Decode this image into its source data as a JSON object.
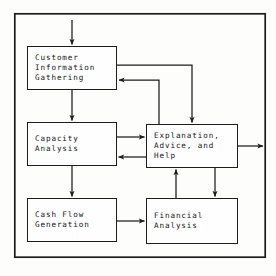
{
  "figure": {
    "caption_partial": "",
    "frame": {
      "border_color": "#1d1d1d",
      "background": "#fdfdfc",
      "x": 14,
      "y": 13,
      "width": 252,
      "height": 245
    },
    "style": {
      "box_border_color": "#1d1d1d",
      "box_fill": "#fefefe",
      "arrow_color": "#1d1d1d",
      "text_color": "#141414"
    }
  },
  "nodes": [
    {
      "id": "customer",
      "name": "customer-information-gathering",
      "lines": [
        "Customer",
        "Information",
        "Gathering"
      ]
    },
    {
      "id": "capacity",
      "name": "capacity-analysis",
      "lines": [
        "Capacity",
        "Analysis"
      ]
    },
    {
      "id": "cashflow",
      "name": "cash-flow-generation",
      "lines": [
        "Cash Flow",
        "Generation"
      ]
    },
    {
      "id": "explanation",
      "name": "explanation-advice-and-help",
      "lines": [
        "Explanation,",
        "Advice, and",
        "Help"
      ]
    },
    {
      "id": "financial",
      "name": "financial-analysis",
      "lines": [
        "Financial",
        "Analysis"
      ]
    }
  ],
  "edges": [
    {
      "id": "entry-to-customer",
      "from": "external-top",
      "to": "customer",
      "direction": "down",
      "label": ""
    },
    {
      "id": "customer-to-capacity",
      "from": "customer",
      "to": "capacity",
      "direction": "down",
      "label": ""
    },
    {
      "id": "capacity-to-cashflow",
      "from": "capacity",
      "to": "cashflow",
      "direction": "down",
      "label": ""
    },
    {
      "id": "customer-to-explanation",
      "from": "customer",
      "to": "explanation",
      "direction": "right-down",
      "label": ""
    },
    {
      "id": "explanation-to-customer",
      "from": "explanation",
      "to": "customer",
      "direction": "up-left",
      "label": ""
    },
    {
      "id": "capacity-to-explanation",
      "from": "capacity",
      "to": "explanation",
      "direction": "right",
      "label": ""
    },
    {
      "id": "explanation-to-capacity",
      "from": "explanation",
      "to": "capacity",
      "direction": "left",
      "label": ""
    },
    {
      "id": "explanation-to-external-right",
      "from": "explanation",
      "to": "external-right",
      "direction": "right",
      "label": ""
    },
    {
      "id": "explanation-to-financial",
      "from": "explanation",
      "to": "financial",
      "direction": "down",
      "label": ""
    },
    {
      "id": "financial-to-explanation",
      "from": "financial",
      "to": "explanation",
      "direction": "up",
      "label": ""
    },
    {
      "id": "cashflow-to-financial",
      "from": "cashflow",
      "to": "financial",
      "direction": "right",
      "label": ""
    }
  ]
}
